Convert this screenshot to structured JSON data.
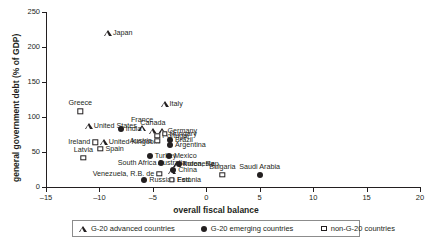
{
  "chart_data": {
    "type": "scatter",
    "title": "",
    "xlabel": "overall fiscal balance",
    "ylabel": "general government debt (% of GDP)",
    "xlim": [
      -15,
      20
    ],
    "ylim": [
      0,
      250
    ],
    "xticks": [
      -15,
      -10,
      -5,
      0,
      5,
      10,
      15,
      20
    ],
    "yticks": [
      0,
      50,
      100,
      150,
      200,
      250
    ],
    "xtick_labels": [
      "–15",
      "–10",
      "–5",
      "0",
      "5",
      "10",
      "15",
      "20"
    ],
    "ytick_labels": [
      "0",
      "50",
      "100",
      "150",
      "200",
      "250"
    ],
    "grid": false,
    "legend_position": "bottom",
    "series": [
      {
        "name": "G-20 advanced countries",
        "marker": "triangle-open",
        "points": [
          {
            "label": "Japan",
            "x": -9.2,
            "y": 220,
            "lpos": "l"
          },
          {
            "label": "Italy",
            "x": -3.9,
            "y": 119,
            "lpos": "l"
          },
          {
            "label": "United States",
            "x": -11.0,
            "y": 87,
            "lpos": "l"
          },
          {
            "label": "United Kingdom",
            "x": -9.6,
            "y": 65,
            "lpos": "l"
          },
          {
            "label": "France",
            "x": -6.0,
            "y": 85,
            "lpos": "c"
          },
          {
            "label": "Canada",
            "x": -5.0,
            "y": 80,
            "lpos": "c"
          },
          {
            "label": "Germany",
            "x": -4.1,
            "y": 80,
            "lpos": "l"
          },
          {
            "label": "Australia",
            "x": -3.2,
            "y": 23,
            "lpos": "c"
          },
          {
            "label": "Korea, Rep.",
            "x": -2.7,
            "y": 33,
            "lpos": "l"
          }
        ]
      },
      {
        "name": "G-20 emerging countries",
        "marker": "circle-filled",
        "points": [
          {
            "label": "India",
            "x": -8.0,
            "y": 83,
            "lpos": "l"
          },
          {
            "label": "Brazil",
            "x": -3.4,
            "y": 67,
            "lpos": "l"
          },
          {
            "label": "Argentina",
            "x": -3.4,
            "y": 60,
            "lpos": "l"
          },
          {
            "label": "Turkey",
            "x": -5.3,
            "y": 44,
            "lpos": "l"
          },
          {
            "label": "Mexico",
            "x": -3.5,
            "y": 44,
            "lpos": "l"
          },
          {
            "label": "South Africa",
            "x": -4.2,
            "y": 35,
            "lpos": "r"
          },
          {
            "label": "Indonesia",
            "x": -2.6,
            "y": 33,
            "lpos": "l"
          },
          {
            "label": "China",
            "x": -3.1,
            "y": 25,
            "lpos": "l"
          },
          {
            "label": "Russian Fed.",
            "x": -5.8,
            "y": 10,
            "lpos": "l"
          },
          {
            "label": "Saudi Arabia",
            "x": 5.0,
            "y": 17,
            "lpos": "c"
          }
        ]
      },
      {
        "name": "non-G-20 countries",
        "marker": "square-open",
        "points": [
          {
            "label": "Greece",
            "x": -11.8,
            "y": 108,
            "lpos": "c"
          },
          {
            "label": "Ireland",
            "x": -10.4,
            "y": 64,
            "lpos": "r"
          },
          {
            "label": "Spain",
            "x": -9.9,
            "y": 55,
            "lpos": "l"
          },
          {
            "label": "Latvia",
            "x": -11.5,
            "y": 42,
            "lpos": "c"
          },
          {
            "label": "Portugal",
            "x": -4.6,
            "y": 73,
            "lpos": "l"
          },
          {
            "label": "Austria",
            "x": -4.6,
            "y": 66,
            "lpos": "r"
          },
          {
            "label": "Hungary",
            "x": -3.9,
            "y": 76,
            "lpos": "l"
          },
          {
            "label": "Venezuela, R.B. de",
            "x": -4.4,
            "y": 19,
            "lpos": "r"
          },
          {
            "label": "Estonia",
            "x": -3.2,
            "y": 10,
            "lpos": "l"
          },
          {
            "label": "Bulgaria",
            "x": 1.5,
            "y": 17,
            "lpos": "c"
          }
        ]
      }
    ]
  },
  "legend": {
    "items": [
      {
        "label": "G-20 advanced countries",
        "marker": "triangle-open"
      },
      {
        "label": "G-20 emerging countries",
        "marker": "circle-filled"
      },
      {
        "label": "non-G-20 countries",
        "marker": "square-open"
      }
    ]
  }
}
